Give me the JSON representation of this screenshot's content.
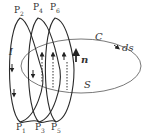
{
  "diagram": {
    "labels": {
      "P2": "P",
      "P2_sub": "2",
      "P4": "P",
      "P4_sub": "4",
      "P6": "P",
      "P6_sub": "6",
      "P1": "P",
      "P1_sub": "1",
      "P3": "P",
      "P3_sub": "3",
      "P5": "P",
      "P5_sub": "5",
      "current": "I",
      "curve": "C",
      "surface": "S",
      "normal": "n",
      "line_element": "ds"
    },
    "colors": {
      "stroke": "#2a2a2a",
      "ellipse": "#555555",
      "background": "#ffffff"
    }
  }
}
